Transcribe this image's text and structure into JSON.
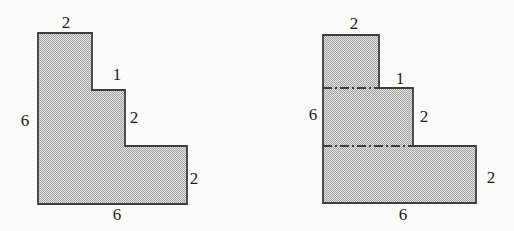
{
  "page": {
    "background": "#fcfcfa"
  },
  "style": {
    "shape_fill_average": "#c6c6c6",
    "shape_fill_dot": "#a3a3a3",
    "shape_fill_base": "#e4e4e4",
    "shape_outline": "#3d3d3d",
    "label_color": "#1a1a1a"
  },
  "figures": [
    {
      "name": "staircase-solid",
      "labels": {
        "top": "2",
        "step": "1",
        "middle_right": "2",
        "left": "6",
        "right": "2",
        "bottom": "6"
      }
    },
    {
      "name": "staircase-partitioned",
      "labels": {
        "top": "2",
        "step": "1",
        "middle_right": "2",
        "left": "6",
        "right": "2",
        "bottom": "6"
      }
    }
  ]
}
